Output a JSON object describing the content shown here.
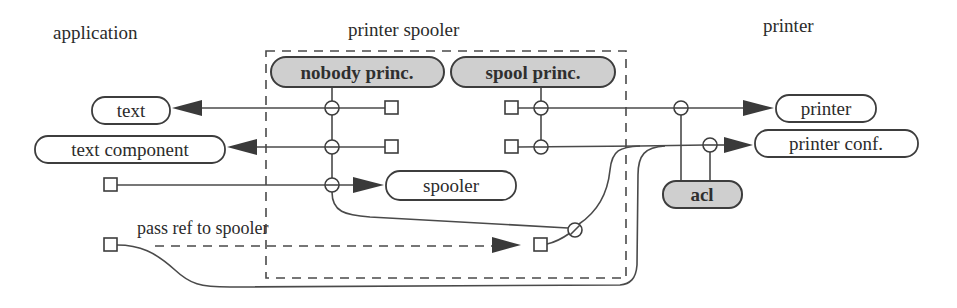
{
  "diagram": {
    "sections": {
      "application": "application",
      "printer_spooler": "printer spooler",
      "printer": "printer"
    },
    "principals": {
      "nobody": "nobody princ.",
      "spool": "spool princ.",
      "acl": "acl"
    },
    "nodes": {
      "text": "text",
      "text_component": "text component",
      "spooler": "spooler",
      "printer": "printer",
      "printer_conf": "printer conf."
    },
    "edge_labels": {
      "pass_ref": "pass ref to spooler"
    },
    "colors": {
      "principal_fill": "#cfcfcf",
      "stroke": "#3d3d3d",
      "arrow": "#3a3a3a",
      "background": "#ffffff"
    }
  }
}
